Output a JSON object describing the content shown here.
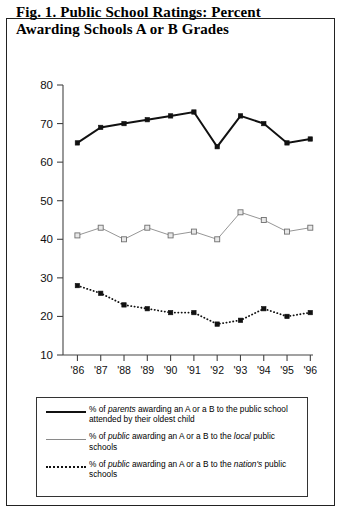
{
  "figure": {
    "title": "Fig. 1. Public School Ratings: Percent Awarding Schools A or B Grades"
  },
  "chart_data": {
    "type": "line",
    "title": "Fig. 1. Public School Ratings: Percent Awarding Schools A or B Grades",
    "xlabel": "",
    "ylabel": "",
    "categories": [
      "'86",
      "'87",
      "'88",
      "'89",
      "'90",
      "'91",
      "'92",
      "'93",
      "'94",
      "'95",
      "'96"
    ],
    "ylim": [
      10,
      80
    ],
    "yticks": [
      10,
      20,
      30,
      40,
      50,
      60,
      70,
      80
    ],
    "grid": false,
    "legend_position": "below-plot",
    "series": [
      {
        "name": "% of parents awarding an A or a B to the public school attended by their oldest child",
        "style": "solid",
        "marker": "filled-square",
        "color": "#111111",
        "values": [
          65,
          69,
          70,
          71,
          72,
          73,
          64,
          72,
          70,
          65,
          66
        ]
      },
      {
        "name": "% of public awarding an A or a B to the local public schools",
        "style": "solid-light",
        "marker": "open-square",
        "color": "#8a8a8a",
        "values": [
          41,
          43,
          40,
          43,
          41,
          42,
          40,
          47,
          45,
          42,
          43
        ]
      },
      {
        "name": "% of public awarding an A or a B to the nation's public schools",
        "style": "dotted",
        "marker": "filled-square",
        "color": "#111111",
        "values": [
          28,
          26,
          23,
          22,
          21,
          21,
          18,
          19,
          22,
          20,
          21
        ]
      }
    ]
  },
  "legend": {
    "items": [
      {
        "key": "solid-line-key",
        "pre": "% of ",
        "em1": "parents",
        "post": " awarding an A or a B to the public school attended by their oldest child"
      },
      {
        "key": "light-line-key",
        "pre": "% of ",
        "em1": "public",
        "mid": " awarding an A or a B to the ",
        "em2": "local",
        "post": " public schools"
      },
      {
        "key": "dotted-line-key",
        "pre": "% of ",
        "em1": "public",
        "mid": " awarding an A or a B to the ",
        "em2": "nation's",
        "post": " public schools"
      }
    ]
  }
}
